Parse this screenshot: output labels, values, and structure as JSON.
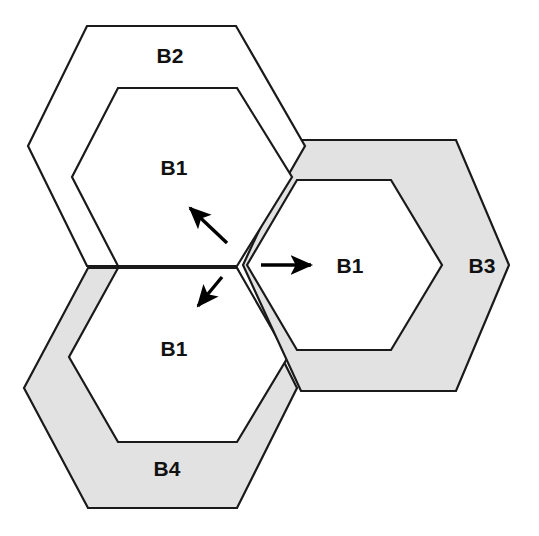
{
  "figure": {
    "width": 539,
    "height": 536,
    "background_color": "#ffffff"
  },
  "colors": {
    "stroke": "#1a1a1a",
    "ring_fill_shaded": "#e2e2e2",
    "ring_fill_plain": "#ffffff",
    "inner_fill": "#ffffff",
    "arrow_color": "#000000",
    "label_color": "#111111"
  },
  "cells": [
    {
      "id": "b2",
      "outer_label": "B2",
      "inner_label": "B1",
      "shaded": false,
      "outer_label_x": 170,
      "outer_label_y": 56,
      "inner_label_x": 174,
      "inner_label_y": 168,
      "outer_points": "87,26 236,26 305,146 236,266 87,266 28,146",
      "inner_points": "118,88 237,88 292,177 237,266 118,266 72,177"
    },
    {
      "id": "b3",
      "outer_label": "B3",
      "inner_label": "B1",
      "shaded": true,
      "outer_label_x": 482,
      "outer_label_y": 266,
      "inner_label_x": 350,
      "inner_label_y": 266,
      "outer_points": "301,140 456,140 509,265 456,391 301,391 243,265",
      "inner_points": "297,180 391,180 442,265 391,350 297,350 247,265"
    },
    {
      "id": "b4",
      "outer_label": "B4",
      "inner_label": "B1",
      "shaded": true,
      "outer_label_x": 167,
      "outer_label_y": 469,
      "inner_label_x": 174,
      "inner_label_y": 349,
      "outer_points": "88,268 237,268 297,388 237,508 88,508 24,388",
      "inner_points": "118,268 237,268 288,357 237,442 118,442 69,357"
    }
  ],
  "arrows": [
    {
      "id": "arrow-up-left",
      "direction": "up-left",
      "x1": 227,
      "y1": 243,
      "x2": 190,
      "y2": 208
    },
    {
      "id": "arrow-right",
      "direction": "right",
      "x1": 261,
      "y1": 265,
      "x2": 311,
      "y2": 265
    },
    {
      "id": "arrow-down-left",
      "direction": "down-left",
      "x1": 222,
      "y1": 277,
      "x2": 198,
      "y2": 306
    }
  ],
  "junction": {
    "label": "three-cell-junction",
    "x": 237,
    "y": 265
  }
}
